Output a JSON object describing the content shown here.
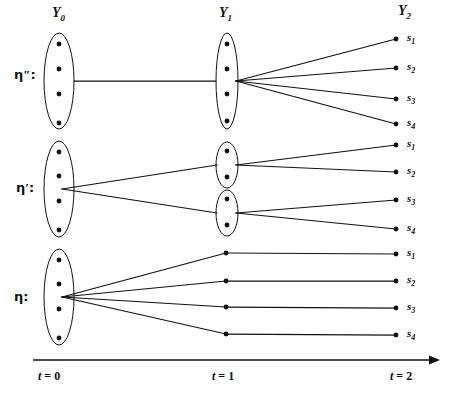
{
  "figure": {
    "type": "information-partition-tree",
    "background_color": "#ffffff",
    "ink_color": "#111111"
  },
  "column_headers": [
    {
      "name": "Y0",
      "base": "Y",
      "sub": "0",
      "x": 52,
      "y": 6
    },
    {
      "name": "Y1",
      "base": "Y",
      "sub": "1",
      "x": 219,
      "y": 6
    },
    {
      "name": "Y2",
      "base": "Y",
      "sub": "2",
      "x": 398,
      "y": 4
    }
  ],
  "row_labels": [
    {
      "name": "eta-double-prime",
      "glyph": "η",
      "prime": "″",
      "colon": ":",
      "x": 14,
      "y": 68
    },
    {
      "name": "eta-prime",
      "glyph": "η",
      "prime": "′",
      "colon": ":",
      "x": 16,
      "y": 181
    },
    {
      "name": "eta",
      "glyph": "η",
      "prime": "",
      "colon": ":",
      "x": 14,
      "y": 290
    }
  ],
  "time_axis": {
    "name": "time-axis",
    "x_start": 33,
    "x_end": 440,
    "y": 360,
    "ticks": [
      {
        "label_it": "t",
        "label_rest": " = 0",
        "x": 38,
        "y": 370
      },
      {
        "label_it": "t",
        "label_rest": " = 1",
        "x": 212,
        "y": 370
      },
      {
        "label_it": "t",
        "label_rest": " = 2",
        "x": 390,
        "y": 370
      }
    ]
  },
  "rows": [
    {
      "name": "row-eta-double-prime",
      "label": "η″",
      "t0": {
        "ellipses": [
          {
            "cx": 59,
            "cy": 81,
            "rx": 15,
            "ry": 48,
            "dots": [
              {
                "x": 59,
                "y": 44
              },
              {
                "x": 59,
                "y": 69
              },
              {
                "x": 59,
                "y": 94
              },
              {
                "x": 59,
                "y": 123
              }
            ]
          }
        ]
      },
      "t1": {
        "ellipses": [
          {
            "cx": 227,
            "cy": 81,
            "rx": 11,
            "ry": 48,
            "dots": [
              {
                "x": 227,
                "y": 44
              },
              {
                "x": 227,
                "y": 69
              },
              {
                "x": 227,
                "y": 94
              },
              {
                "x": 227,
                "y": 121
              }
            ]
          }
        ]
      },
      "t2": {
        "terminals": [
          {
            "label": "s",
            "sub": "1",
            "x": 398,
            "y": 39
          },
          {
            "label": "s",
            "sub": "2",
            "x": 398,
            "y": 68
          },
          {
            "label": "s",
            "sub": "3",
            "x": 398,
            "y": 99
          },
          {
            "label": "s",
            "sub": "4",
            "x": 398,
            "y": 124
          }
        ]
      },
      "edges": [
        {
          "from": [
            74,
            81
          ],
          "to": [
            216,
            81
          ]
        },
        {
          "from": [
            236,
            81
          ],
          "to": [
            396,
            39
          ]
        },
        {
          "from": [
            236,
            81
          ],
          "to": [
            396,
            68
          ]
        },
        {
          "from": [
            236,
            81
          ],
          "to": [
            396,
            99
          ]
        },
        {
          "from": [
            236,
            81
          ],
          "to": [
            396,
            124
          ]
        }
      ]
    },
    {
      "name": "row-eta-prime",
      "label": "η′",
      "t0": {
        "ellipses": [
          {
            "cx": 59,
            "cy": 189,
            "rx": 15,
            "ry": 48,
            "dots": [
              {
                "x": 59,
                "y": 152
              },
              {
                "x": 59,
                "y": 176
              },
              {
                "x": 59,
                "y": 201
              },
              {
                "x": 59,
                "y": 230
              }
            ]
          }
        ]
      },
      "t1": {
        "ellipses": [
          {
            "cx": 227,
            "cy": 165,
            "rx": 11,
            "ry": 23,
            "dots": [
              {
                "x": 227,
                "y": 151
              },
              {
                "x": 227,
                "y": 177
              }
            ]
          },
          {
            "cx": 227,
            "cy": 213,
            "rx": 11,
            "ry": 23,
            "dots": [
              {
                "x": 227,
                "y": 199
              },
              {
                "x": 227,
                "y": 225
              }
            ]
          }
        ]
      },
      "t2": {
        "terminals": [
          {
            "label": "s",
            "sub": "1",
            "x": 398,
            "y": 145
          },
          {
            "label": "s",
            "sub": "2",
            "x": 398,
            "y": 172
          },
          {
            "label": "s",
            "sub": "3",
            "x": 398,
            "y": 200
          },
          {
            "label": "s",
            "sub": "4",
            "x": 398,
            "y": 229
          }
        ]
      },
      "edges": [
        {
          "from": [
            62,
            189
          ],
          "to": [
            217,
            165
          ]
        },
        {
          "from": [
            62,
            189
          ],
          "to": [
            217,
            213
          ]
        },
        {
          "from": [
            236,
            165
          ],
          "to": [
            396,
            145
          ]
        },
        {
          "from": [
            236,
            165
          ],
          "to": [
            396,
            172
          ]
        },
        {
          "from": [
            236,
            213
          ],
          "to": [
            396,
            200
          ]
        },
        {
          "from": [
            236,
            213
          ],
          "to": [
            396,
            229
          ]
        }
      ]
    },
    {
      "name": "row-eta",
      "label": "η",
      "t0": {
        "ellipses": [
          {
            "cx": 59,
            "cy": 297,
            "rx": 15,
            "ry": 48,
            "dots": [
              {
                "x": 59,
                "y": 260
              },
              {
                "x": 59,
                "y": 284
              },
              {
                "x": 59,
                "y": 309
              },
              {
                "x": 59,
                "y": 338
              }
            ]
          }
        ]
      },
      "t1": {
        "dots": [
          {
            "x": 226,
            "y": 253
          },
          {
            "x": 226,
            "y": 281
          },
          {
            "x": 226,
            "y": 307
          },
          {
            "x": 226,
            "y": 334
          }
        ]
      },
      "t2": {
        "terminals": [
          {
            "label": "s",
            "sub": "1",
            "x": 398,
            "y": 254
          },
          {
            "label": "s",
            "sub": "2",
            "x": 398,
            "y": 281
          },
          {
            "label": "s",
            "sub": "3",
            "x": 398,
            "y": 308
          },
          {
            "label": "s",
            "sub": "4",
            "x": 398,
            "y": 335
          }
        ]
      },
      "edges": [
        {
          "from": [
            62,
            297
          ],
          "to": [
            226,
            253
          ]
        },
        {
          "from": [
            62,
            297
          ],
          "to": [
            226,
            281
          ]
        },
        {
          "from": [
            62,
            297
          ],
          "to": [
            226,
            307
          ]
        },
        {
          "from": [
            62,
            297
          ],
          "to": [
            226,
            334
          ]
        },
        {
          "from": [
            226,
            253
          ],
          "to": [
            396,
            254
          ]
        },
        {
          "from": [
            226,
            281
          ],
          "to": [
            396,
            281
          ]
        },
        {
          "from": [
            226,
            307
          ],
          "to": [
            396,
            308
          ]
        },
        {
          "from": [
            226,
            334
          ],
          "to": [
            396,
            335
          ]
        }
      ]
    }
  ]
}
